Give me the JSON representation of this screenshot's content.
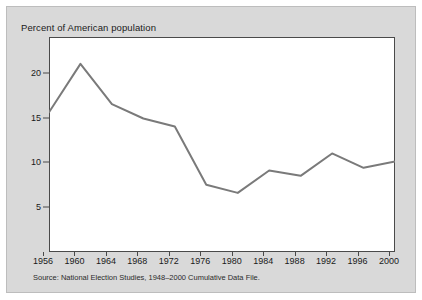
{
  "page": {
    "background_color": "#ffffff",
    "card_color": "#d9d9d9",
    "plot_background": "#ffffff"
  },
  "figure": {
    "title": "Percent of American population",
    "source_note": "Source:  National Election Studies, 1948–2000 Cumulative Data File."
  },
  "chart_data": {
    "type": "line",
    "title": "Percent of American population",
    "xlabel": "",
    "ylabel": "",
    "categories": [
      "1956",
      "1960",
      "1964",
      "1968",
      "1972",
      "1976",
      "1980",
      "1984",
      "1988",
      "1992",
      "1996",
      "2000"
    ],
    "x": [
      1956,
      1960,
      1964,
      1968,
      1972,
      1976,
      1980,
      1984,
      1988,
      1992,
      1996,
      2000
    ],
    "values": [
      15.6,
      21.0,
      16.5,
      14.9,
      14.0,
      7.5,
      6.6,
      9.1,
      8.5,
      11.0,
      9.4,
      10.1
    ],
    "series": [
      {
        "name": "Percent of American population",
        "values": [
          15.6,
          21.0,
          16.5,
          14.9,
          14.0,
          7.5,
          6.6,
          9.1,
          8.5,
          11.0,
          9.4,
          10.1
        ],
        "color": "#7a7a7a"
      }
    ],
    "ylim": [
      0,
      24
    ],
    "xlim": [
      1956,
      2000
    ],
    "yticks": [
      5,
      10,
      15,
      20
    ],
    "ytick_labels": [
      "5",
      "10",
      "15",
      "20"
    ],
    "xticks": [
      1956,
      1960,
      1964,
      1968,
      1972,
      1976,
      1980,
      1984,
      1988,
      1992,
      1996,
      2000
    ],
    "grid": false,
    "legend": false,
    "line_color": "#7a7a7a",
    "line_width": 2,
    "axis_color": "#4a4a4a"
  }
}
